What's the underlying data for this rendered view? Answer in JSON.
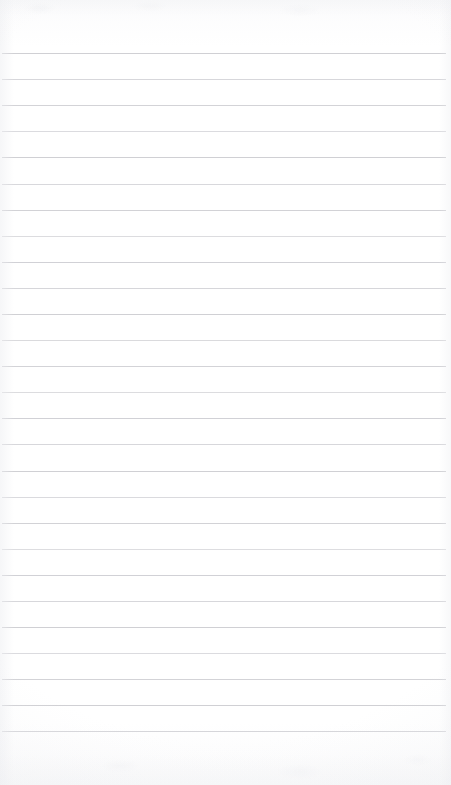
{
  "document": {
    "kind": "lined-notebook-page",
    "title": "Blank ruled notebook page",
    "width": 451,
    "height": 785,
    "orientation": "portrait",
    "text_content": "",
    "has_handwriting": false,
    "has_printed_text": false,
    "page_number": ""
  },
  "paper": {
    "background_color": "#fdfdfd",
    "edge_shade_color": "#eceef1",
    "top_margin_px": 53,
    "bottom_margin_px": 54,
    "left_margin_px": 2,
    "right_margin_px": 5
  },
  "ruling": {
    "style": "horizontal-ruled",
    "line_color": "#cdcdd2",
    "line_thickness_px": 1,
    "line_spacing_px": 26.1,
    "line_count": 27,
    "first_line_y": 53,
    "last_line_y": 731,
    "line_start_x": 2,
    "line_end_x": 446,
    "has_left_margin_rule": false,
    "has_header_rule": false,
    "line_y_positions": [
      53,
      79,
      105,
      131,
      157,
      184,
      210,
      236,
      262,
      288,
      314,
      340,
      366,
      392,
      418,
      444,
      471,
      497,
      523,
      549,
      575,
      601,
      627,
      653,
      679,
      705,
      731
    ],
    "line_opacities": [
      0.95,
      0.8,
      0.88,
      0.72,
      0.95,
      0.78,
      0.9,
      0.7,
      0.92,
      0.82,
      0.95,
      0.75,
      0.88,
      0.7,
      0.92,
      0.8,
      0.95,
      0.74,
      0.9,
      0.68,
      0.92,
      0.8,
      0.95,
      0.72,
      0.88,
      0.95,
      0.82
    ]
  }
}
